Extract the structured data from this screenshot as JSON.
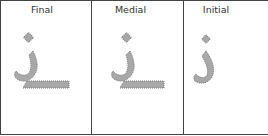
{
  "panels": [
    {
      "label": "Final",
      "glyph": "dhal-final-form"
    },
    {
      "label": "Medial",
      "glyph": "dhal-medial-form"
    },
    {
      "label": "Initial",
      "glyph": "dhal-initial-form"
    }
  ],
  "colors": {
    "glyph_fill": "#a8a8a8",
    "glyph_stroke": "#7a7a7a",
    "border": "#444444",
    "label": "#333333"
  }
}
